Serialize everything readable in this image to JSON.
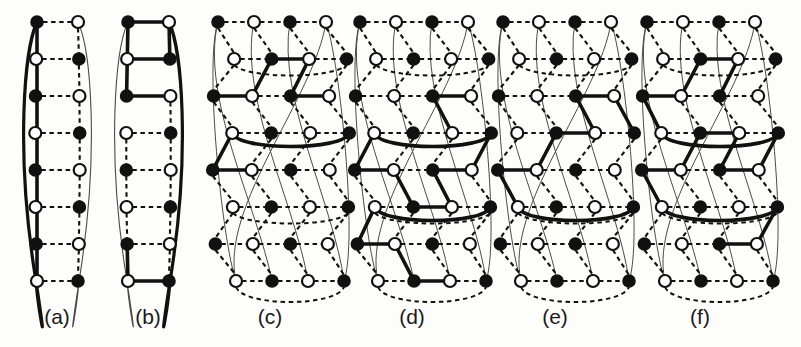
{
  "figure": {
    "background_color": "#fdfdfc",
    "ink_color": "#111111",
    "thin_color": "#4a4a4a",
    "node_fill_dark": "#111111",
    "node_fill_light": "#ffffff",
    "width": 801,
    "height": 347,
    "panel_count": 6
  },
  "captions": [
    {
      "label": "(a)",
      "x": 57,
      "y": 305
    },
    {
      "label": "(b)",
      "x": 148,
      "y": 305
    },
    {
      "label": "(c)",
      "x": 270,
      "y": 305
    },
    {
      "label": "(d)",
      "x": 412,
      "y": 305
    },
    {
      "label": "(e)",
      "x": 555,
      "y": 305
    },
    {
      "label": "(f)",
      "x": 700,
      "y": 305
    }
  ],
  "chart_data": {
    "type": "diagram",
    "title": "",
    "panels": [
      {
        "id": "a",
        "label": "(a)",
        "columns": 2,
        "rows": 8,
        "x0": 37,
        "col_gap": 41,
        "y0": 22,
        "row_gap": 37,
        "node_radius": 6,
        "bulge": 13,
        "node_fills": [
          [
            "dark",
            "light"
          ],
          [
            "light",
            "dark"
          ],
          [
            "dark",
            "light"
          ],
          [
            "light",
            "dark"
          ],
          [
            "dark",
            "light"
          ],
          [
            "light",
            "dark"
          ],
          [
            "dark",
            "light"
          ],
          [
            "light",
            "dark"
          ]
        ],
        "dashed_horizontal_rows": [
          0,
          1,
          2,
          3,
          4,
          5,
          6,
          7
        ],
        "dashed_vertical": [
          {
            "col": 1,
            "from": 0,
            "to": 7
          }
        ],
        "thick_vertical": [
          {
            "col": 0,
            "from": 0,
            "to": 7
          }
        ],
        "thick_horizontal": [],
        "wrap_edges": [
          {
            "row_from": 0,
            "row_to": 7,
            "side": "left",
            "style": "thick"
          },
          {
            "row_from": 0,
            "row_to": 7,
            "side": "right",
            "style": "thin"
          }
        ]
      },
      {
        "id": "b",
        "label": "(b)",
        "columns": 2,
        "rows": 8,
        "x0": 128,
        "col_gap": 41,
        "y0": 22,
        "row_gap": 37,
        "node_radius": 6,
        "bulge": 13,
        "node_fills": [
          [
            "dark",
            "light"
          ],
          [
            "light",
            "dark"
          ],
          [
            "dark",
            "light"
          ],
          [
            "light",
            "dark"
          ],
          [
            "dark",
            "light"
          ],
          [
            "light",
            "dark"
          ],
          [
            "dark",
            "light"
          ],
          [
            "light",
            "dark"
          ]
        ],
        "dashed_horizontal_rows": [
          3,
          4,
          5,
          6
        ],
        "dashed_vertical": [
          {
            "col": 1,
            "from": 2,
            "to": 7
          },
          {
            "col": 0,
            "from": 3,
            "to": 6
          }
        ],
        "thick_vertical": [
          {
            "col": 0,
            "from": 0,
            "to": 2
          },
          {
            "col": 1,
            "from": 0,
            "to": 1
          },
          {
            "col": 0,
            "from": 6,
            "to": 7
          }
        ],
        "thick_horizontal": [
          {
            "row": 0,
            "from": 0,
            "to": 1
          },
          {
            "row": 1,
            "from": 0,
            "to": 1
          },
          {
            "row": 2,
            "from": 0,
            "to": 1
          },
          {
            "row": 7,
            "from": 0,
            "to": 1
          }
        ],
        "wrap_edges": [
          {
            "row_from": 0,
            "row_to": 7,
            "side": "left",
            "style": "thin"
          },
          {
            "row_from": 0,
            "row_to": 7,
            "side": "right",
            "style": "thick"
          }
        ]
      },
      {
        "id": "c",
        "label": "(c)",
        "columns": 4,
        "rows": 8,
        "x0": 218,
        "col_gap": 36,
        "y0": 22,
        "row_gap": 37,
        "node_radius": 6,
        "bulge": 14,
        "row_offset_odd": 18,
        "node_fills": [
          [
            "dark",
            "light",
            "dark",
            "light"
          ],
          [
            "light",
            "dark",
            "light",
            "dark"
          ],
          [
            "dark",
            "light",
            "dark",
            "light"
          ],
          [
            "light",
            "dark",
            "light",
            "dark"
          ],
          [
            "dark",
            "light",
            "dark",
            "light"
          ],
          [
            "light",
            "dark",
            "light",
            "dark"
          ],
          [
            "dark",
            "light",
            "dark",
            "light"
          ],
          [
            "light",
            "dark",
            "light",
            "dark"
          ]
        ],
        "thick_horizontal": [
          {
            "row": 1,
            "from": 1,
            "to": 2
          },
          {
            "row": 2,
            "from": 0,
            "to": 1
          },
          {
            "row": 2,
            "from": 2,
            "to": 3
          },
          {
            "row": 4,
            "from": 0,
            "to": 1
          }
        ],
        "thick_vertical": [
          {
            "col": 1,
            "from": 1,
            "to": 2
          },
          {
            "col": 2,
            "from": 1,
            "to": 2
          },
          {
            "col": 0,
            "from": 3,
            "to": 4
          }
        ],
        "thick_arcs": [
          {
            "row": 3,
            "from_col": 0,
            "to_col": 3,
            "depth": 12
          }
        ],
        "dashed_horizontal_rows": [
          0,
          1,
          2,
          3,
          4,
          5,
          6,
          7
        ],
        "dashed_vertical_all": true,
        "wrap_count": 4
      },
      {
        "id": "d",
        "label": "(d)",
        "columns": 4,
        "rows": 8,
        "x0": 360,
        "col_gap": 36,
        "y0": 22,
        "row_gap": 37,
        "node_radius": 6,
        "bulge": 14,
        "row_offset_odd": 18,
        "node_fills": [
          [
            "dark",
            "light",
            "dark",
            "light"
          ],
          [
            "light",
            "dark",
            "light",
            "dark"
          ],
          [
            "dark",
            "light",
            "dark",
            "light"
          ],
          [
            "light",
            "dark",
            "light",
            "dark"
          ],
          [
            "dark",
            "light",
            "dark",
            "light"
          ],
          [
            "light",
            "dark",
            "light",
            "dark"
          ],
          [
            "dark",
            "light",
            "dark",
            "light"
          ],
          [
            "light",
            "dark",
            "light",
            "dark"
          ]
        ],
        "thick_horizontal": [
          {
            "row": 2,
            "from": 2,
            "to": 3
          },
          {
            "row": 4,
            "from": 0,
            "to": 1
          },
          {
            "row": 4,
            "from": 2,
            "to": 3
          },
          {
            "row": 5,
            "from": 1,
            "to": 2
          },
          {
            "row": 6,
            "from": 0,
            "to": 1
          },
          {
            "row": 7,
            "from": 1,
            "to": 2
          }
        ],
        "thick_vertical": [
          {
            "col": 2,
            "from": 2,
            "to": 3
          },
          {
            "col": 0,
            "from": 3,
            "to": 4
          },
          {
            "col": 1,
            "from": 4,
            "to": 5
          },
          {
            "col": 2,
            "from": 4,
            "to": 5
          },
          {
            "col": 0,
            "from": 5,
            "to": 6
          },
          {
            "col": 1,
            "from": 6,
            "to": 7
          },
          {
            "col": 3,
            "from": 3,
            "to": 4
          }
        ],
        "thick_arcs": [
          {
            "row": 3,
            "from_col": 0,
            "to_col": 3,
            "depth": 12
          },
          {
            "row": 5,
            "from_col": 0,
            "to_col": 3,
            "depth": 12
          }
        ],
        "dashed_horizontal_rows": [
          0,
          1,
          2,
          3,
          4,
          5,
          6,
          7
        ],
        "dashed_vertical_all": true,
        "wrap_count": 4
      },
      {
        "id": "e",
        "label": "(e)",
        "columns": 4,
        "rows": 8,
        "x0": 503,
        "col_gap": 36,
        "y0": 22,
        "row_gap": 37,
        "node_radius": 6,
        "bulge": 14,
        "row_offset_odd": 18,
        "node_fills": [
          [
            "dark",
            "light",
            "dark",
            "light"
          ],
          [
            "light",
            "dark",
            "light",
            "dark"
          ],
          [
            "dark",
            "light",
            "dark",
            "light"
          ],
          [
            "light",
            "dark",
            "light",
            "dark"
          ],
          [
            "dark",
            "light",
            "dark",
            "light"
          ],
          [
            "light",
            "dark",
            "light",
            "dark"
          ],
          [
            "dark",
            "light",
            "dark",
            "light"
          ],
          [
            "light",
            "dark",
            "light",
            "dark"
          ]
        ],
        "thick_horizontal": [
          {
            "row": 2,
            "from": 2,
            "to": 3
          },
          {
            "row": 3,
            "from": 1,
            "to": 2
          },
          {
            "row": 4,
            "from": 0,
            "to": 1
          }
        ],
        "thick_vertical": [
          {
            "col": 2,
            "from": 2,
            "to": 3
          },
          {
            "col": 1,
            "from": 3,
            "to": 4
          },
          {
            "col": 0,
            "from": 4,
            "to": 5
          },
          {
            "col": 3,
            "from": 2,
            "to": 3
          }
        ],
        "thick_arcs": [
          {
            "row": 5,
            "from_col": 0,
            "to_col": 3,
            "depth": 12
          }
        ],
        "dashed_horizontal_rows": [
          0,
          1,
          2,
          3,
          4,
          5,
          6,
          7
        ],
        "dashed_vertical_all": true,
        "wrap_count": 4
      },
      {
        "id": "f",
        "label": "(f)",
        "columns": 4,
        "rows": 8,
        "x0": 647,
        "col_gap": 36,
        "y0": 22,
        "row_gap": 37,
        "node_radius": 6,
        "bulge": 14,
        "row_offset_odd": 18,
        "node_fills": [
          [
            "dark",
            "light",
            "dark",
            "light"
          ],
          [
            "light",
            "dark",
            "light",
            "dark"
          ],
          [
            "dark",
            "light",
            "dark",
            "light"
          ],
          [
            "light",
            "dark",
            "light",
            "dark"
          ],
          [
            "dark",
            "light",
            "dark",
            "light"
          ],
          [
            "light",
            "dark",
            "light",
            "dark"
          ],
          [
            "dark",
            "light",
            "dark",
            "light"
          ],
          [
            "light",
            "dark",
            "light",
            "dark"
          ]
        ],
        "thick_horizontal": [
          {
            "row": 1,
            "from": 1,
            "to": 2
          },
          {
            "row": 2,
            "from": 0,
            "to": 1
          },
          {
            "row": 3,
            "from": 1,
            "to": 2
          },
          {
            "row": 4,
            "from": 0,
            "to": 1
          },
          {
            "row": 4,
            "from": 2,
            "to": 3
          },
          {
            "row": 6,
            "from": 2,
            "to": 3
          }
        ],
        "thick_vertical": [
          {
            "col": 1,
            "from": 1,
            "to": 2
          },
          {
            "col": 2,
            "from": 1,
            "to": 2
          },
          {
            "col": 0,
            "from": 2,
            "to": 3
          },
          {
            "col": 1,
            "from": 3,
            "to": 4
          },
          {
            "col": 3,
            "from": 3,
            "to": 4
          },
          {
            "col": 0,
            "from": 4,
            "to": 5
          },
          {
            "col": 3,
            "from": 5,
            "to": 6
          },
          {
            "col": 2,
            "from": 3,
            "to": 4
          }
        ],
        "thick_arcs": [
          {
            "row": 3,
            "from_col": 0,
            "to_col": 3,
            "depth": 12
          },
          {
            "row": 5,
            "from_col": 0,
            "to_col": 3,
            "depth": 12
          }
        ],
        "dashed_horizontal_rows": [
          0,
          1,
          2,
          3,
          4,
          5,
          6,
          7
        ],
        "dashed_vertical_all": true,
        "wrap_count": 4
      }
    ]
  }
}
